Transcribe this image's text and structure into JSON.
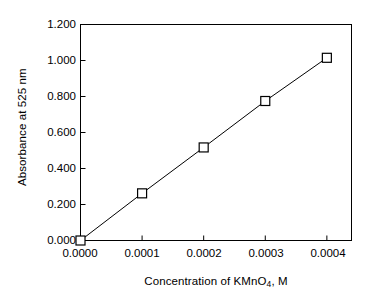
{
  "chart_data": {
    "type": "scatter",
    "title": "",
    "xlabel": "Concentration of KMnO4, M",
    "xlabel_prefix": "Concentration of KMnO",
    "xlabel_sub": "4",
    "xlabel_suffix": ", M",
    "ylabel": "Absorbance at 525 nm",
    "x": [
      0.0,
      0.0001,
      0.0002,
      0.0003,
      0.0004
    ],
    "values": [
      0.0,
      0.262,
      0.517,
      0.775,
      1.015
    ],
    "series": [
      {
        "name": "Absorbance at 525 nm",
        "x": [
          0.0,
          0.0001,
          0.0002,
          0.0003,
          0.0004
        ],
        "values": [
          0.0,
          0.262,
          0.517,
          0.775,
          1.015
        ]
      }
    ],
    "xlim": [
      0.0,
      0.00044
    ],
    "ylim": [
      0.0,
      1.2
    ],
    "xticks": [
      0.0,
      0.0001,
      0.0002,
      0.0003,
      0.0004
    ],
    "xtick_labels": [
      "0.0000",
      "0.0001",
      "0.0002",
      "0.0003",
      "0.0004"
    ],
    "yticks": [
      0.0,
      0.2,
      0.4,
      0.6,
      0.8,
      1.0,
      1.2
    ],
    "ytick_labels": [
      "0.000",
      "0.200",
      "0.400",
      "0.600",
      "0.800",
      "1.000",
      "1.200"
    ],
    "grid": false,
    "legend": null,
    "marker": "open-square",
    "line_color": "#000000",
    "marker_edge_color": "#000000",
    "marker_face_color": "#ffffff",
    "axes_color": "#000000",
    "background_color": "#ffffff"
  }
}
